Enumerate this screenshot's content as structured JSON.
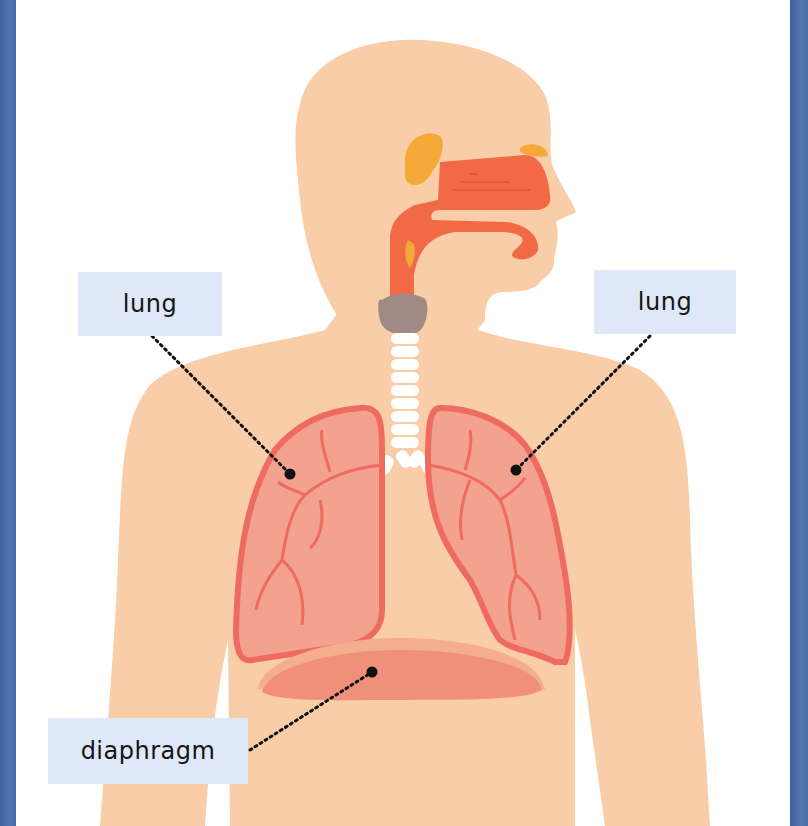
{
  "diagram": {
    "labels": [
      {
        "id": "lung-left",
        "text": "lung"
      },
      {
        "id": "lung-right",
        "text": "lung"
      },
      {
        "id": "diaphragm",
        "text": "diaphragm"
      }
    ],
    "colors": {
      "border": "#4d6fa8",
      "page": "#ffffff",
      "skin": "#f9cda8",
      "airway": "#f26a45",
      "sinus": "#f3a838",
      "larynx": "#a08a84",
      "trachea": "#ffffff",
      "lung_fill": "#f4a290",
      "lung_outline": "#ef6b61",
      "diaphragm_outer": "#f5ad8f",
      "diaphragm_inner": "#f0907a",
      "label_bg": "#dfe8f6",
      "pointer": "#111111"
    }
  }
}
